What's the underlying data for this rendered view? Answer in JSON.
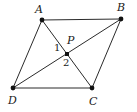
{
  "figure": {
    "kind": "geometry-diagram",
    "canvas": {
      "width": 137,
      "height": 112,
      "background": "#ffffff"
    },
    "style": {
      "stroke_color": "#2b2b2b",
      "stroke_width": 1,
      "point_color": "#111111",
      "point_radius": 2.4,
      "center_point_shape": "square",
      "center_point_size": 4
    },
    "points": [
      {
        "id": "A",
        "label": "A",
        "x": 42,
        "y": 20,
        "label_x": 35,
        "label_y": 4,
        "marker": "dot"
      },
      {
        "id": "B",
        "label": "B",
        "x": 121,
        "y": 19,
        "label_x": 117,
        "label_y": 2,
        "marker": "dot"
      },
      {
        "id": "C",
        "label": "C",
        "x": 92,
        "y": 88,
        "label_x": 89,
        "label_y": 96,
        "marker": "dot"
      },
      {
        "id": "D",
        "label": "D",
        "x": 13,
        "y": 88,
        "label_x": 8,
        "label_y": 95,
        "marker": "dot"
      },
      {
        "id": "P",
        "label": "P",
        "x": 67,
        "y": 54,
        "label_x": 67,
        "label_y": 35,
        "marker": "square"
      }
    ],
    "segments": [
      {
        "id": "AB",
        "from": "A",
        "to": "B",
        "role": "side"
      },
      {
        "id": "BC",
        "from": "B",
        "to": "C",
        "role": "side"
      },
      {
        "id": "CD",
        "from": "C",
        "to": "D",
        "role": "side"
      },
      {
        "id": "DA",
        "from": "D",
        "to": "A",
        "role": "side"
      },
      {
        "id": "AC",
        "from": "A",
        "to": "C",
        "role": "diagonal"
      },
      {
        "id": "BD",
        "from": "B",
        "to": "D",
        "role": "diagonal"
      }
    ],
    "angle_labels": [
      {
        "id": "angle-1",
        "label": "1",
        "x": 54,
        "y": 43
      },
      {
        "id": "angle-2",
        "label": "2",
        "x": 63,
        "y": 58
      }
    ]
  }
}
